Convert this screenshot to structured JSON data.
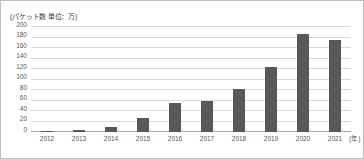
{
  "chart_data": {
    "type": "bar",
    "title": "",
    "unit_caption": "(パケット数 単位：万)",
    "xlabel": "(年)",
    "ylabel": "",
    "categories": [
      "2012",
      "2013",
      "2014",
      "2015",
      "2016",
      "2017",
      "2018",
      "2019",
      "2020",
      "2021"
    ],
    "values": [
      2,
      3,
      10,
      26,
      55,
      60,
      81,
      124,
      186,
      175
    ],
    "ylim": [
      0,
      200
    ],
    "ytick_labels": [
      "200",
      "180",
      "160",
      "140",
      "120",
      "100",
      "80",
      "60",
      "40",
      "20",
      "0"
    ],
    "ytick_values": [
      200,
      180,
      160,
      140,
      120,
      100,
      80,
      60,
      40,
      20,
      0
    ],
    "ytick_step": 20,
    "grid": true,
    "legend": "none",
    "bar_color": "#595959",
    "grid_color": "#d9d9d9",
    "axis_color": "#a6a6a6",
    "background_color": "#ffffff",
    "border_color": "#bfbfbf"
  }
}
